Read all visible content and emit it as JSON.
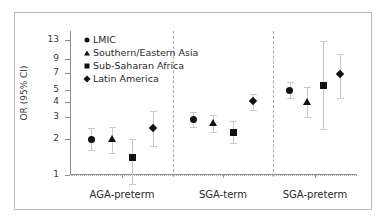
{
  "chart_data": {
    "type": "scatter",
    "title": "",
    "xlabel": "",
    "ylabel": "OR (95% CI)",
    "yscale": "log",
    "ylim": [
      1,
      15
    ],
    "yticks": [
      1,
      2,
      3,
      4,
      5,
      7,
      9,
      13
    ],
    "ytick_labels": [
      "1",
      "2",
      "3",
      "4",
      "5",
      "7",
      "9",
      "13"
    ],
    "grid": false,
    "reference_line": 1,
    "legend_position": "top-left",
    "legend": [
      {
        "label": "LMIC",
        "marker": "circle"
      },
      {
        "label": "Southern/Eastern Asia",
        "marker": "triangle"
      },
      {
        "label": "Sub-Saharan Africa",
        "marker": "square"
      },
      {
        "label": "Latin America",
        "marker": "diamond"
      }
    ],
    "categories": [
      "AGA-preterm",
      "SGA-term",
      "SGA-preterm"
    ],
    "series": [
      {
        "name": "LMIC",
        "marker": "circle",
        "points": [
          {
            "category": "AGA-preterm",
            "or": 1.97,
            "lo": 1.6,
            "hi": 2.45
          },
          {
            "category": "SGA-term",
            "or": 2.86,
            "lo": 2.47,
            "hi": 3.3
          },
          {
            "category": "SGA-preterm",
            "or": 5.02,
            "lo": 4.3,
            "hi": 5.9
          }
        ]
      },
      {
        "name": "Southern/Eastern Asia",
        "marker": "triangle",
        "points": [
          {
            "category": "AGA-preterm",
            "or": 1.97,
            "lo": 1.53,
            "hi": 2.5
          },
          {
            "category": "SGA-term",
            "or": 2.68,
            "lo": 2.27,
            "hi": 3.1
          },
          {
            "category": "SGA-preterm",
            "or": 4.0,
            "lo": 3.0,
            "hi": 5.3
          }
        ]
      },
      {
        "name": "Sub-Saharan Africa",
        "marker": "square",
        "points": [
          {
            "category": "AGA-preterm",
            "or": 1.4,
            "lo": 0.84,
            "hi": 1.97
          },
          {
            "category": "SGA-term",
            "or": 2.26,
            "lo": 1.82,
            "hi": 2.8
          },
          {
            "category": "SGA-preterm",
            "or": 5.45,
            "lo": 2.4,
            "hi": 12.8
          }
        ]
      },
      {
        "name": "Latin America",
        "marker": "diamond",
        "points": [
          {
            "category": "AGA-preterm",
            "or": 2.42,
            "lo": 1.72,
            "hi": 3.37
          },
          {
            "category": "SGA-term",
            "or": 4.08,
            "lo": 3.42,
            "hi": 4.7
          },
          {
            "category": "SGA-preterm",
            "or": 6.8,
            "lo": 4.35,
            "hi": 9.9
          }
        ]
      }
    ]
  }
}
